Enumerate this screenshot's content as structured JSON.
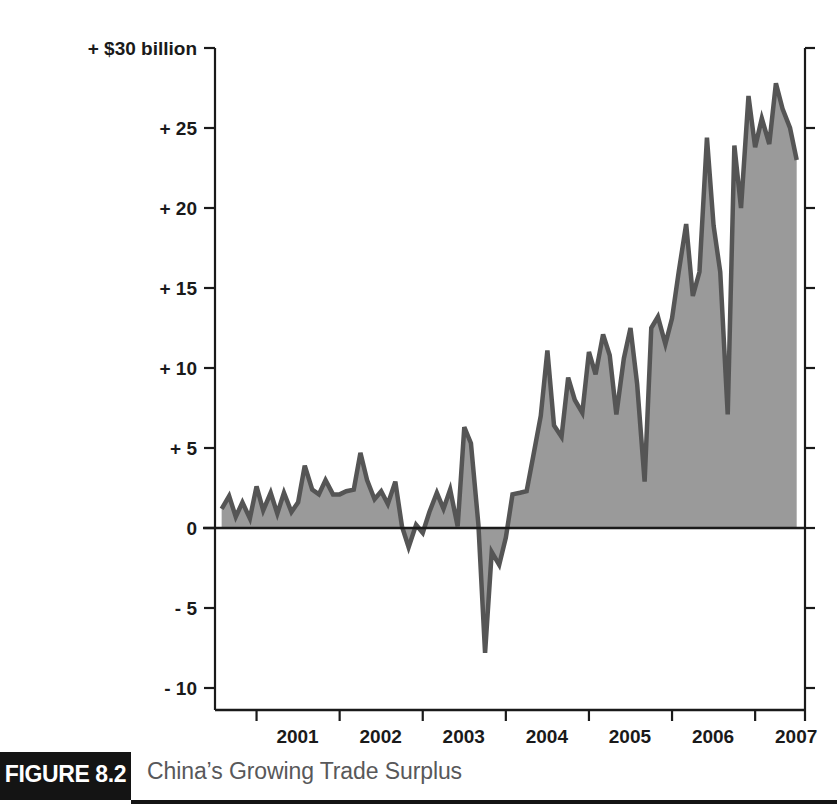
{
  "figure": {
    "badge_label": "FIGURE 8.2",
    "caption": "China’s Growing Trade Surplus"
  },
  "chart_data": {
    "type": "area",
    "title": "China’s Growing Trade Surplus",
    "xlabel": "",
    "ylabel": "+ $30 billion",
    "ylim": [
      -10,
      30
    ],
    "xlim": [
      2000.5,
      2007.6
    ],
    "grid": false,
    "legend": null,
    "y_tick_labels": [
      "+ $30 billion",
      "+ 25",
      "+ 20",
      "+ 15",
      "+ 10",
      "+ 5",
      "0",
      "- 5",
      "- 10"
    ],
    "y_tick_values": [
      30,
      25,
      20,
      15,
      10,
      5,
      0,
      -5,
      -10
    ],
    "x_tick_labels": [
      "2001",
      "2002",
      "2003",
      "2004",
      "2005",
      "2006",
      "2007"
    ],
    "x_tick_values": [
      2001,
      2002,
      2003,
      2004,
      2005,
      2006,
      2007
    ],
    "colors": {
      "area_fill": "#9a9a9a",
      "line_stroke": "#555555",
      "axis": "#1a1a1a",
      "caption_text": "#58585a",
      "badge_background": "#141414",
      "badge_text": "#ffffff"
    },
    "series": [
      {
        "name": "China monthly trade balance ($ billion)",
        "x": [
          2000.58,
          2000.67,
          2000.75,
          2000.83,
          2000.92,
          2001.0,
          2001.08,
          2001.17,
          2001.25,
          2001.33,
          2001.42,
          2001.5,
          2001.58,
          2001.67,
          2001.75,
          2001.83,
          2001.92,
          2002.0,
          2002.08,
          2002.17,
          2002.25,
          2002.33,
          2002.42,
          2002.5,
          2002.58,
          2002.67,
          2002.75,
          2002.83,
          2002.92,
          2003.0,
          2003.08,
          2003.17,
          2003.25,
          2003.33,
          2003.42,
          2003.5,
          2003.58,
          2003.67,
          2003.75,
          2003.83,
          2003.92,
          2004.0,
          2004.08,
          2004.17,
          2004.25,
          2004.33,
          2004.42,
          2004.5,
          2004.58,
          2004.67,
          2004.75,
          2004.83,
          2004.92,
          2005.0,
          2005.08,
          2005.17,
          2005.25,
          2005.33,
          2005.42,
          2005.5,
          2005.58,
          2005.67,
          2005.75,
          2005.83,
          2005.92,
          2006.0,
          2006.08,
          2006.17,
          2006.25,
          2006.33,
          2006.42,
          2006.5,
          2006.58,
          2006.67,
          2006.75,
          2006.83,
          2006.92,
          2007.0,
          2007.08,
          2007.17,
          2007.25,
          2007.33,
          2007.42,
          2007.5
        ],
        "values": [
          1.2,
          2.0,
          0.7,
          1.6,
          0.6,
          2.6,
          1.1,
          2.2,
          0.9,
          2.2,
          1.0,
          1.6,
          3.9,
          2.4,
          2.1,
          3.0,
          2.1,
          2.1,
          2.3,
          2.4,
          4.7,
          3.0,
          1.8,
          2.3,
          1.5,
          2.9,
          0.1,
          -1.2,
          0.2,
          -0.3,
          1.0,
          2.2,
          1.2,
          2.4,
          0.1,
          6.3,
          5.3,
          0.2,
          -7.8,
          -1.5,
          -2.3,
          -0.6,
          2.1,
          2.2,
          2.3,
          4.5,
          7.0,
          11.1,
          6.4,
          5.7,
          9.4,
          8.0,
          7.2,
          11.0,
          9.6,
          12.1,
          10.8,
          7.1,
          10.6,
          12.5,
          9.0,
          2.9,
          12.5,
          13.2,
          11.5,
          13.1,
          16.0,
          19.0,
          14.5,
          16.0,
          24.4,
          18.9,
          16.0,
          7.1,
          23.9,
          20.0,
          27.0,
          23.8,
          25.6,
          24.0,
          27.8,
          26.2,
          25.0,
          23.0
        ]
      }
    ]
  },
  "axis_geometry": {
    "left_px": 215,
    "right_px": 805,
    "zero_y_px": 528,
    "px_per_unit": 16,
    "top_y_px": 48,
    "bottom_y_px": 688,
    "x_start_year": 2000.5,
    "x_end_year": 2007.6
  }
}
